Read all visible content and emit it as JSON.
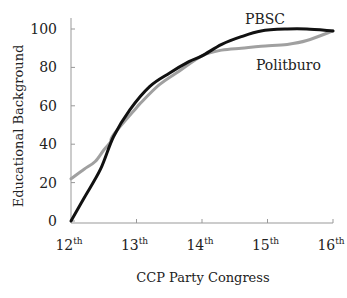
{
  "chart_data": {
    "type": "line",
    "title": "",
    "xlabel": "CCP Party Congress",
    "ylabel": "Educational Background",
    "xlim": [
      12,
      16
    ],
    "ylim": [
      0,
      100
    ],
    "grid": false,
    "legend_position": "inline labels near line ends",
    "x_ticks": [
      {
        "value": 12,
        "base": "12",
        "sup": "th"
      },
      {
        "value": 13,
        "base": "13",
        "sup": "th"
      },
      {
        "value": 14,
        "base": "14",
        "sup": "th"
      },
      {
        "value": 15,
        "base": "15",
        "sup": "th"
      },
      {
        "value": 16,
        "base": "16",
        "sup": "th"
      }
    ],
    "y_ticks": [
      0,
      20,
      40,
      60,
      80,
      100
    ],
    "series": [
      {
        "name": "PBSC",
        "color": "#111111",
        "line_width": 3,
        "x": [
          12.0,
          12.2,
          12.45,
          12.65,
          12.9,
          13.2,
          13.5,
          13.8,
          14.0,
          14.3,
          14.6,
          14.9,
          15.3,
          15.6,
          16.0
        ],
        "values": [
          0,
          12,
          27,
          44,
          58,
          70,
          77,
          83,
          86,
          92,
          96,
          99,
          100,
          100,
          99
        ]
      },
      {
        "name": "Politburo",
        "color": "#a0a0a0",
        "line_width": 3,
        "x": [
          12.0,
          12.2,
          12.37,
          12.5,
          12.6,
          12.65,
          13.0,
          13.05,
          13.35,
          13.65,
          14.0,
          14.3,
          14.6,
          14.9,
          15.3,
          15.6,
          16.0
        ],
        "values": [
          22,
          27,
          31,
          37,
          41,
          45,
          59,
          61,
          71,
          78,
          86,
          89,
          90,
          91,
          92,
          94,
          99
        ]
      }
    ],
    "annotations": [
      {
        "text": "PBSC",
        "x": 15.0,
        "y": 102
      },
      {
        "text": "Politburo",
        "x": 15.0,
        "y": 78
      }
    ]
  }
}
